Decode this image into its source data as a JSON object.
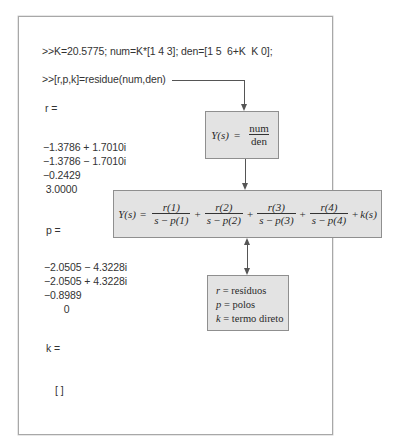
{
  "console": {
    "command1": ">>K=20.5775; num=K*[1 4 3]; den=[1 5  6+K  K 0];",
    "command2": ">>[r,p,k]=residue(num,den)",
    "r_label": "r =",
    "r_values": [
      "−1.3786 + 1.7010i",
      "−1.3786 − 1.7010i",
      "−0.2429",
      " 3.0000"
    ],
    "p_label": "p =",
    "p_values": [
      "−2.0505 − 4.3228i",
      "−2.0505 + 4.3228i",
      "−0.8989",
      "       0"
    ],
    "k_label": "k =",
    "k_value": "[ ]"
  },
  "diagram": {
    "transfer_box": {
      "lhs": "Y(s)",
      "equals": "=",
      "numerator": "num",
      "denominator": "den"
    },
    "expansion_box": {
      "lhs": "Y(s)",
      "equals": "=",
      "terms": [
        {
          "num": "r(1)",
          "den_s": "s",
          "den_minus": "−",
          "den_p": "p(1)"
        },
        {
          "num": "r(2)",
          "den_s": "s",
          "den_minus": "−",
          "den_p": "p(2)"
        },
        {
          "num": "r(3)",
          "den_s": "s",
          "den_minus": "−",
          "den_p": "p(3)"
        },
        {
          "num": "r(4)",
          "den_s": "s",
          "den_minus": "−",
          "den_p": "p(4)"
        }
      ],
      "plus": "+",
      "direct_term": "k(s)"
    },
    "legend_box": {
      "items": [
        {
          "symbol": "r",
          "text": " = resíduos"
        },
        {
          "symbol": "p",
          "text": " = polos"
        },
        {
          "symbol": "k",
          "text": " = termo direto"
        }
      ]
    }
  },
  "colors": {
    "box_fill": "#e3e3e3",
    "box_border": "#8f8f8f",
    "frame_border": "#a8a8a8",
    "connector": "#555555"
  }
}
